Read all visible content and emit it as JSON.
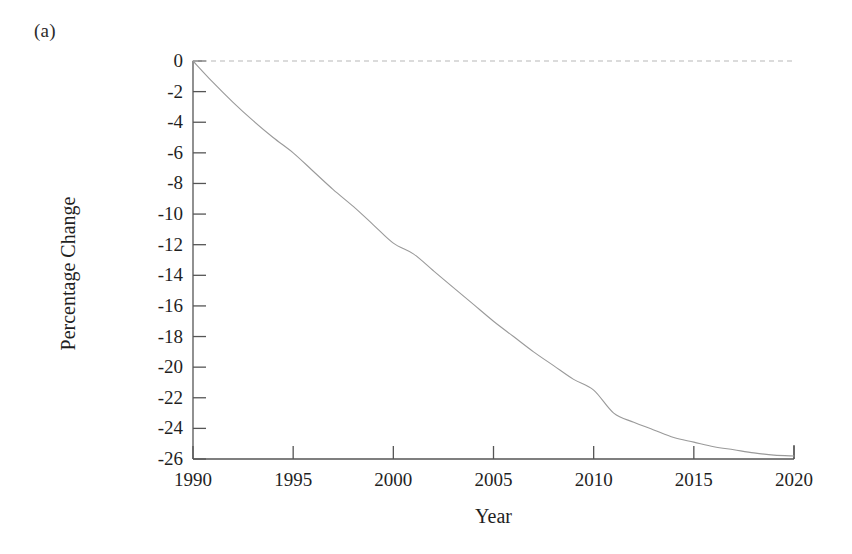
{
  "figure": {
    "panel_label": "(a)",
    "background_color": "#ffffff"
  },
  "chart_data": {
    "type": "line",
    "title": "",
    "subtitle": "",
    "panel": "(a)",
    "xlabel": "Year",
    "ylabel": "Percentage Change",
    "xlim": [
      1990,
      2020
    ],
    "ylim": [
      -26,
      0
    ],
    "grid": false,
    "legend": false,
    "legend_position": "none",
    "xticks": [
      1990,
      1995,
      2000,
      2005,
      2010,
      2015,
      2020
    ],
    "xtick_labels": [
      "1990",
      "1995",
      "2000",
      "2005",
      "2010",
      "2015",
      "2020"
    ],
    "yticks": [
      0,
      -2,
      -4,
      -6,
      -8,
      -10,
      -12,
      -14,
      -16,
      -18,
      -20,
      -22,
      -24,
      -26
    ],
    "ytick_labels": [
      "0",
      "-2",
      "-4",
      "-6",
      "-8",
      "-10",
      "-12",
      "-14",
      "-16",
      "-18",
      "-20",
      "-22",
      "-24",
      "-26"
    ],
    "line_color": "#9a9a9a",
    "line_width": 1.1,
    "zero_reference_line": {
      "value": 0,
      "style": "dashed",
      "color": "#b8b8b8"
    },
    "series": [
      {
        "name": "Percentage Change",
        "x": [
          1990,
          1991,
          1992,
          1993,
          1994,
          1995,
          1996,
          1997,
          1998,
          1999,
          2000,
          2001,
          2002,
          2003,
          2004,
          2005,
          2006,
          2007,
          2008,
          2009,
          2010,
          2011,
          2012,
          2013,
          2014,
          2015,
          2016,
          2017,
          2018,
          2019,
          2020
        ],
        "values": [
          0.0,
          -1.4,
          -2.7,
          -3.9,
          -5.0,
          -6.0,
          -7.2,
          -8.4,
          -9.5,
          -10.7,
          -11.9,
          -12.6,
          -13.7,
          -14.8,
          -15.9,
          -17.0,
          -18.0,
          -19.0,
          -19.9,
          -20.8,
          -21.5,
          -23.0,
          -23.6,
          -24.1,
          -24.6,
          -24.9,
          -25.2,
          -25.4,
          -25.6,
          -25.75,
          -25.8
        ]
      }
    ]
  },
  "axes": {
    "y_axis_label": "Percentage Change",
    "x_axis_label": "Year"
  }
}
